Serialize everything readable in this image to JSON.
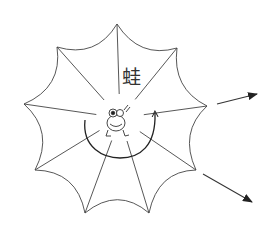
{
  "diagram": {
    "label": "蛙",
    "label_position": {
      "x": 122,
      "y": 68
    },
    "stroke_color": "#333333",
    "center": {
      "x": 120,
      "y": 118
    },
    "web_vertices": [
      {
        "x": 117,
        "y": 24
      },
      {
        "x": 177,
        "y": 48
      },
      {
        "x": 207,
        "y": 106
      },
      {
        "x": 196,
        "y": 170
      },
      {
        "x": 149,
        "y": 213
      },
      {
        "x": 85,
        "y": 213
      },
      {
        "x": 35,
        "y": 170
      },
      {
        "x": 24,
        "y": 104
      },
      {
        "x": 57,
        "y": 47
      }
    ],
    "arrows": [
      {
        "from": {
          "x": 217,
          "y": 104
        },
        "to": {
          "x": 257,
          "y": 94
        }
      },
      {
        "from": {
          "x": 203,
          "y": 174
        },
        "to": {
          "x": 252,
          "y": 202
        }
      }
    ],
    "center_figure": "frog",
    "rotation_arc": "curved arrow around frog"
  }
}
